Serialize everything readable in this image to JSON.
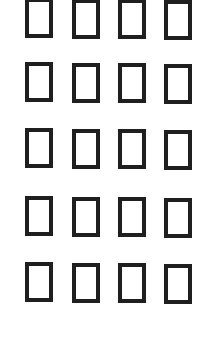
{
  "glyph_grid": {
    "description": "missing-glyph placeholder boxes (tofu)",
    "rows": 5,
    "columns": 4,
    "border_color": "#1f1f1f",
    "background_color": "#ffffff",
    "cells": [
      [
        "▯",
        "▯",
        "▯",
        "▯"
      ],
      [
        "▯",
        "▯",
        "▯",
        "▯"
      ],
      [
        "▯",
        "▯",
        "▯",
        "▯"
      ],
      [
        "▯",
        "▯",
        "▯",
        "▯"
      ],
      [
        "▯",
        "▯",
        "▯",
        "▯"
      ]
    ]
  }
}
